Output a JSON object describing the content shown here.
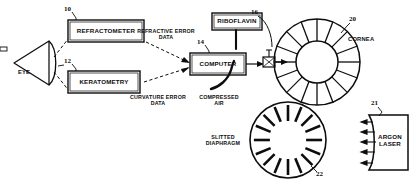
{
  "figure": {
    "ink_color": "#0d0d0d",
    "background": "#ffffff"
  },
  "boxes": {
    "refractometer": {
      "label": "REFRACTOMETER",
      "ref": "10"
    },
    "keratometry": {
      "label": "KERATOMETRY",
      "ref": "12"
    },
    "computer": {
      "label": "COMPUTER",
      "ref": "14"
    },
    "riboflavin": {
      "label": "RIBOFLAVIN",
      "ref": ""
    },
    "argon_laser": {
      "label": "ARGON\nLASER",
      "ref": "21"
    }
  },
  "parts": {
    "eye": {
      "label": "EYE"
    },
    "cornea": {
      "label": "CORNEA",
      "ref": "20"
    },
    "nozzle": {
      "ref": "16"
    },
    "slitted_diaphragm": {
      "label": "SLITTED\nDIAPHRAGM",
      "ref": "22"
    }
  },
  "flow_labels": {
    "refractive_error": "REFRACTIVE ERROR\nDATA",
    "curvature_error": "CURVATURE ERROR\nDATA",
    "compressed_air": "COMPRESSED\nAIR"
  }
}
